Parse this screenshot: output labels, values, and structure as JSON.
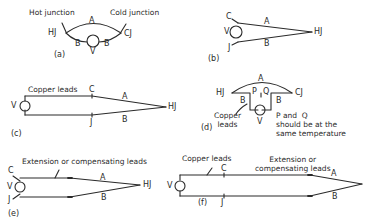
{
  "figure": {
    "panels": [
      {
        "id": "a",
        "caption": "(a)",
        "labels": {
          "hot_junction": "Hot junction",
          "cold_junction": "Cold junction",
          "hj": "HJ",
          "cj": "CJ",
          "a": "A",
          "b_left": "B",
          "b_right": "B",
          "v": "V"
        }
      },
      {
        "id": "b",
        "caption": "(b)",
        "labels": {
          "c": "C",
          "v": "V",
          "j": "J",
          "a": "A",
          "b": "B",
          "hj": "HJ"
        }
      },
      {
        "id": "c",
        "caption": "(c)",
        "labels": {
          "copper_leads": "Copper leads",
          "c": "C",
          "a": "A",
          "v": "V",
          "j": "J",
          "b": "B",
          "hj": "HJ"
        }
      },
      {
        "id": "d",
        "caption": "(d)",
        "labels": {
          "a": "A",
          "hj": "HJ",
          "cj": "CJ",
          "p": "P",
          "q": "Q",
          "b_left": "B",
          "b_right": "B",
          "v": "V",
          "copper_leads": "Copper\nleads",
          "note": "P and  Q\nshould be at the\nsame temperature"
        }
      },
      {
        "id": "e",
        "caption": "(e)",
        "labels": {
          "extension_leads": "Extension or compensating leads",
          "c": "C",
          "v": "V",
          "j": "J",
          "a": "A",
          "b": "B",
          "hj": "HJ"
        }
      },
      {
        "id": "f",
        "caption": "(f)",
        "labels": {
          "copper_leads": "Copper leads",
          "extension_leads": "Extension or\ncompensating leads",
          "c": "C",
          "v": "V",
          "j": "J",
          "a": "A",
          "b": "B"
        }
      }
    ],
    "colors": {
      "ink": "#2a2a2a",
      "background": "#ffffff"
    }
  }
}
